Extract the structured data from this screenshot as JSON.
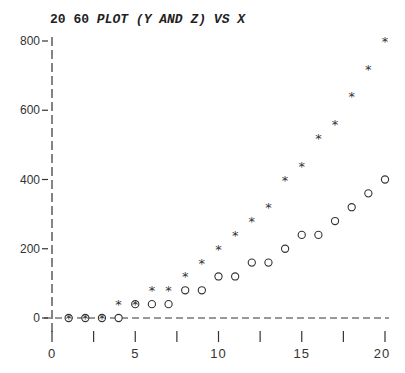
{
  "chart_data": {
    "type": "scatter",
    "title_prefix": "20 60",
    "title_main": "PLOT (Y AND Z) VS X",
    "title": "20 60 PLOT (Y AND Z) VS X",
    "xlabel": "",
    "ylabel": "",
    "xlim": [
      0,
      20
    ],
    "ylim": [
      0,
      800
    ],
    "x_ticks": [
      0,
      5,
      10,
      15,
      20
    ],
    "x_tick_labels": [
      "0",
      "5",
      "10",
      "15",
      "20"
    ],
    "y_ticks": [
      0,
      200,
      400,
      600,
      800
    ],
    "y_tick_labels": [
      "0",
      "200",
      "400",
      "600",
      "800"
    ],
    "grid": false,
    "legend": null,
    "x": [
      1,
      2,
      3,
      4,
      5,
      6,
      7,
      8,
      9,
      10,
      11,
      12,
      13,
      14,
      15,
      16,
      17,
      18,
      19,
      20
    ],
    "series": [
      {
        "name": "Y",
        "marker": "circle",
        "values": [
          0,
          0,
          0,
          0,
          40,
          40,
          40,
          80,
          80,
          120,
          120,
          160,
          160,
          200,
          240,
          240,
          280,
          320,
          360,
          400
        ]
      },
      {
        "name": "Z",
        "marker": "star",
        "values": [
          0,
          0,
          0,
          40,
          40,
          80,
          80,
          120,
          160,
          200,
          240,
          280,
          320,
          400,
          440,
          520,
          560,
          640,
          720,
          800
        ]
      }
    ]
  }
}
